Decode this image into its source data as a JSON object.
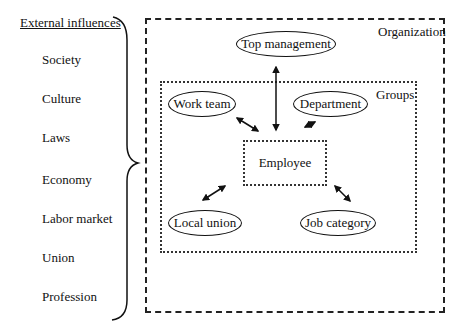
{
  "external": {
    "title": "External influences",
    "items": [
      "Society",
      "Culture",
      "Laws",
      "Economy",
      "Labor market",
      "Union",
      "Profession"
    ]
  },
  "organization": {
    "label": "Organization",
    "top_node": "Top management"
  },
  "groups": {
    "label": "Groups",
    "nodes": [
      "Work team",
      "Department",
      "Local union",
      "Job category"
    ]
  },
  "center": {
    "label": "Employee"
  }
}
